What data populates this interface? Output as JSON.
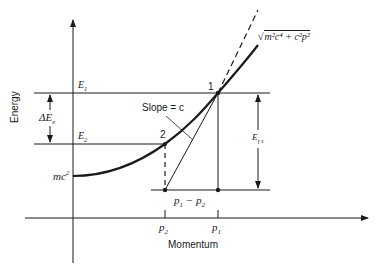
{
  "diagram": {
    "type": "energy-momentum",
    "axes": {
      "y_label": "Energy",
      "x_label": "Momentum"
    },
    "labels": {
      "E1": "E",
      "E1_sub": "1",
      "E2": "E",
      "E2_sub": "2",
      "delta_E": "ΔE",
      "delta_E_sub": "e",
      "rest_energy": "mc",
      "rest_energy_sup": "2",
      "point1": "1",
      "point2": "2",
      "slope": "Slope = c",
      "curve_sqrt": "√",
      "curve_formula": "m²c⁴ + c²p²",
      "E_gamma": "E",
      "E_gamma_sub": "γ s",
      "p1": "p",
      "p1_sub": "1",
      "p2": "p",
      "p2_sub": "2",
      "p_diff": "p",
      "p_diff_sub1": "1",
      "p_diff_mid": " − p",
      "p_diff_sub2": "2"
    },
    "colors": {
      "ink": "#1a1a1a",
      "background": "#ffffff"
    }
  }
}
